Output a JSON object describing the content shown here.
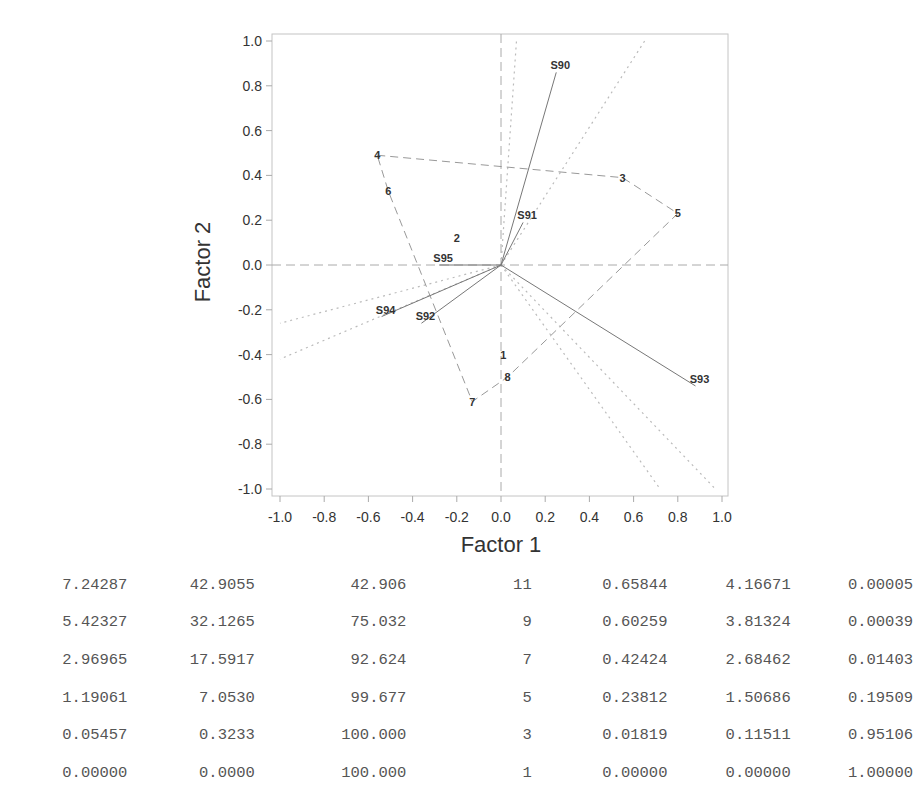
{
  "header": {
    "cut_off_title": "... pying ... g ... p ..."
  },
  "chart_data": {
    "type": "scatter",
    "subtype": "biplot",
    "title": "",
    "xlabel": "Factor 1",
    "ylabel": "Factor 2",
    "xlim": [
      -1.0,
      1.0
    ],
    "ylim": [
      -1.0,
      1.0
    ],
    "x_ticks": [
      "-1.0",
      "-0.8",
      "-0.6",
      "-0.4",
      "-0.2",
      "0.0",
      "0.2",
      "0.4",
      "0.6",
      "0.8",
      "1.0"
    ],
    "y_ticks": [
      "1.0",
      "0.8",
      "0.6",
      "0.4",
      "0.2",
      "0.0",
      "-0.2",
      "-0.4",
      "-0.6",
      "-0.8",
      "-1.0"
    ],
    "grid": false,
    "reference_lines": {
      "x": 0.0,
      "y": 0.0,
      "style": "dashed"
    },
    "variable_vectors": [
      {
        "label": "S90",
        "x": 0.25,
        "y": 0.86
      },
      {
        "label": "S91",
        "x": 0.1,
        "y": 0.19
      },
      {
        "label": "S92",
        "x": -0.36,
        "y": -0.26
      },
      {
        "label": "S93",
        "x": 0.88,
        "y": -0.54
      },
      {
        "label": "S94",
        "x": -0.54,
        "y": -0.23
      },
      {
        "label": "S95",
        "x": -0.28,
        "y": 0.0
      }
    ],
    "observations": [
      {
        "label": "1",
        "x": 0.01,
        "y": -0.4
      },
      {
        "label": "2",
        "x": -0.2,
        "y": 0.12
      },
      {
        "label": "3",
        "x": 0.55,
        "y": 0.39
      },
      {
        "label": "4",
        "x": -0.56,
        "y": 0.49
      },
      {
        "label": "5",
        "x": 0.8,
        "y": 0.23
      },
      {
        "label": "6",
        "x": -0.51,
        "y": 0.33
      },
      {
        "label": "7",
        "x": -0.13,
        "y": -0.61
      },
      {
        "label": "8",
        "x": 0.03,
        "y": -0.5
      }
    ],
    "hull_order": [
      "4",
      "3",
      "5",
      "8",
      "7",
      "6",
      "4"
    ],
    "dotted_rays": [
      {
        "x": 0.07,
        "y": 1.0
      },
      {
        "x": 0.65,
        "y": 1.0
      },
      {
        "x": -1.0,
        "y": -0.26
      },
      {
        "x": -1.0,
        "y": -0.42
      },
      {
        "x": 0.72,
        "y": -1.0
      },
      {
        "x": 0.97,
        "y": -1.0
      }
    ]
  },
  "table": {
    "rows": [
      [
        "7.24287",
        "42.9055",
        "42.906",
        "11",
        "0.65844",
        "4.16671",
        "0.00005"
      ],
      [
        "5.42327",
        "32.1265",
        "75.032",
        "9",
        "0.60259",
        "3.81324",
        "0.00039"
      ],
      [
        "2.96965",
        "17.5917",
        "92.624",
        "7",
        "0.42424",
        "2.68462",
        "0.01403"
      ],
      [
        "1.19061",
        "7.0530",
        "99.677",
        "5",
        "0.23812",
        "1.50686",
        "0.19509"
      ],
      [
        "0.05457",
        "0.3233",
        "100.000",
        "3",
        "0.01819",
        "0.11511",
        "0.95106"
      ],
      [
        "0.00000",
        "0.0000",
        "100.000",
        "1",
        "0.00000",
        "0.00000",
        "1.00000"
      ]
    ]
  },
  "colors": {
    "frame": "#b8b8b8",
    "vector": "#777777",
    "hull": "#999999",
    "dotted": "#bbbbbb",
    "text": "#333333",
    "table_text": "#555555"
  }
}
